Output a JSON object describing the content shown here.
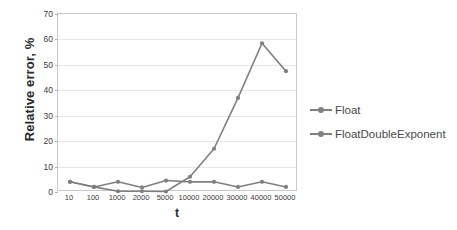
{
  "chart_data": {
    "type": "line",
    "title": "",
    "xlabel": "t",
    "ylabel": "Relative error, %",
    "categories": [
      "10",
      "100",
      "1000",
      "2000",
      "5000",
      "10000",
      "20000",
      "30000",
      "40000",
      "50000"
    ],
    "ylim": [
      0,
      70
    ],
    "yticks": [
      0,
      10,
      20,
      30,
      40,
      50,
      60,
      70
    ],
    "grid": true,
    "legend_position": "right",
    "series": [
      {
        "name": "Float",
        "color": "#808080",
        "marker": "circle",
        "values": [
          4.0,
          2.0,
          4.0,
          1.8,
          4.5,
          4.0,
          4.0,
          2.0,
          4.0,
          2.0
        ]
      },
      {
        "name": "FloatDoubleExponent",
        "color": "#808080",
        "marker": "circle",
        "values": [
          4.0,
          2.0,
          0.3,
          0.3,
          0.2,
          6.0,
          17.0,
          37.0,
          58.5,
          47.5
        ]
      }
    ]
  },
  "axes": {
    "ylabel": "Relative error, %",
    "xlabel": "t"
  },
  "colors": {
    "series": "#808080",
    "grid": "#e4e8ee",
    "frame": "#c8c8c8",
    "text": "#3a3a3a",
    "background": "#ffffff"
  }
}
